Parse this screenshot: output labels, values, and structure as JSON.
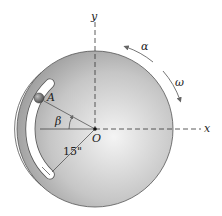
{
  "figure": {
    "type": "rotating slotted disk diagram",
    "labels": {
      "y_axis": "y",
      "x_axis": "x",
      "origin": "O",
      "point": "A",
      "angle": "β",
      "angular_accel": "α",
      "angular_vel": "ω",
      "radius": "15\""
    },
    "colors": {
      "disk_light": "#f2f2f2",
      "disk_dark": "#8f8f8f",
      "outline": "#555555",
      "ball": "#6b6b6b",
      "text": "#222222"
    }
  }
}
